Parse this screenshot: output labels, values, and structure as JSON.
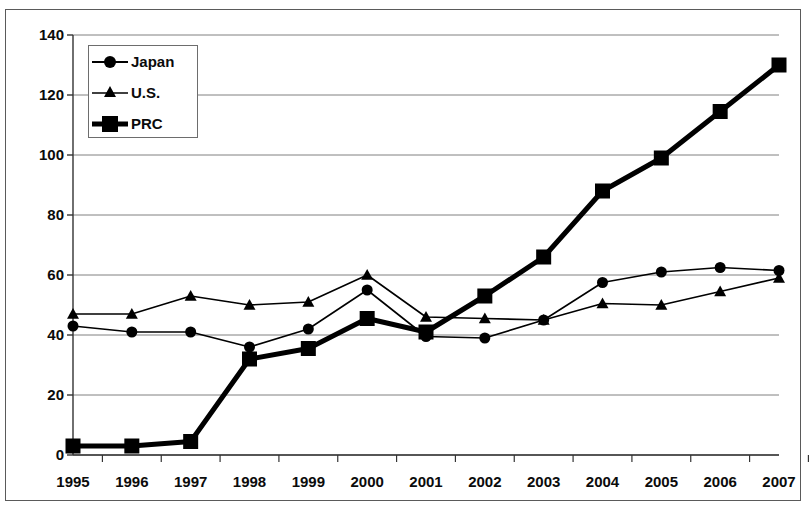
{
  "chart_data": {
    "type": "line",
    "title": "",
    "subtitle": "",
    "xlabel": "",
    "ylabel": "",
    "categories": [
      "1995",
      "1996",
      "1997",
      "1998",
      "1999",
      "2000",
      "2001",
      "2002",
      "2003",
      "2004",
      "2005",
      "2006",
      "2007"
    ],
    "xlim": [
      1995,
      2007
    ],
    "ylim": [
      0,
      140
    ],
    "yticks": [
      0,
      20,
      40,
      60,
      80,
      100,
      120,
      140
    ],
    "ytick_labels": [
      "0",
      "20",
      "40",
      "60",
      "80",
      "100",
      "120",
      "140"
    ],
    "grid": true,
    "grid_axis": "y",
    "legend_position": "top-left",
    "series": [
      {
        "name": "Japan",
        "marker": "circle",
        "color": "#000000",
        "line_width": 1.6,
        "values": [
          43,
          41,
          41,
          36,
          42,
          55,
          39.5,
          39,
          45,
          57.5,
          61,
          62.5,
          61.5
        ]
      },
      {
        "name": "U.S.",
        "marker": "triangle",
        "color": "#000000",
        "line_width": 1.6,
        "values": [
          47,
          47,
          53,
          50,
          51,
          60,
          46,
          45.5,
          45,
          50.5,
          50,
          54.5,
          59
        ]
      },
      {
        "name": "PRC",
        "marker": "square",
        "color": "#000000",
        "line_width": 5,
        "values": [
          3,
          3,
          4.5,
          32,
          35.5,
          45.5,
          41,
          53,
          66,
          88,
          99,
          114.5,
          130
        ]
      }
    ]
  },
  "legend": {
    "items": [
      {
        "label": "Japan",
        "marker": "circle-marker"
      },
      {
        "label": "U.S.",
        "marker": "triangle-marker"
      },
      {
        "label": "PRC",
        "marker": "square-marker"
      }
    ]
  },
  "axes": {
    "y_tick_labels": [
      "140",
      "120",
      "100",
      "80",
      "60",
      "40",
      "20",
      "0"
    ],
    "x_tick_labels": [
      "1995",
      "1996",
      "1997",
      "1998",
      "1999",
      "2000",
      "2001",
      "2002",
      "2003",
      "2004",
      "2005",
      "2006",
      "2007"
    ]
  }
}
